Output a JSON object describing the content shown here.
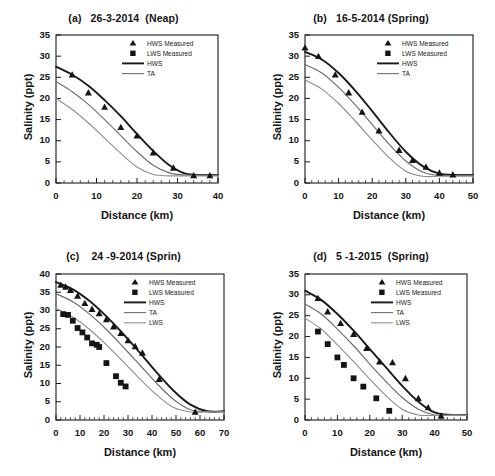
{
  "figure": {
    "background": "#ffffff",
    "panel_count": 4
  },
  "common": {
    "xlabel": "Distance (km)",
    "ylabel": "Salinity (ppt)",
    "legend_labels": {
      "hws_measured": "HWS Measured",
      "lws_measured": "LWS Measured",
      "hws": "HWS",
      "ta": "TA",
      "lws": "LWS"
    },
    "colors": {
      "hws_line": "#1a1a1a",
      "ta_line": "#6e6e6e",
      "lws_line": "#8f8f8f",
      "marker": "#141414",
      "axis": "#1a1a1a",
      "text": "#141414"
    }
  },
  "chart_data": [
    {
      "id": "a",
      "type": "scatter",
      "title": "(a)   26-3-2014  (Neap)",
      "xlabel": "Distance (km)",
      "ylabel": "Salinity (ppt)",
      "xlim": [
        0,
        40
      ],
      "ylim": [
        0,
        35
      ],
      "xticks": [
        0,
        10,
        20,
        30,
        40
      ],
      "yticks": [
        0,
        5,
        10,
        15,
        20,
        25,
        30,
        35
      ],
      "grid": false,
      "legend_position": "top-right",
      "legend": [
        "HWS Measured",
        "LWS Measured",
        "HWS",
        "TA"
      ],
      "series": [
        {
          "name": "HWS Measured",
          "marker": "triangle",
          "x": [
            4,
            8,
            12,
            16,
            20,
            24,
            29,
            34,
            38
          ],
          "y": [
            25.6,
            21.4,
            18.0,
            13.2,
            11.2,
            7.2,
            3.6,
            1.8,
            1.8
          ]
        },
        {
          "name": "HWS",
          "marker": "line",
          "color": "#1a1a1a",
          "x": [
            0,
            4,
            8,
            12,
            16,
            20,
            24,
            28,
            32,
            36,
            40
          ],
          "y": [
            27.5,
            25.6,
            23.0,
            19.6,
            15.8,
            11.6,
            7.6,
            4.2,
            2.2,
            1.9,
            1.9
          ]
        },
        {
          "name": "TA",
          "marker": "line",
          "color": "#6e6e6e",
          "x": [
            0,
            4,
            8,
            12,
            16,
            20,
            24,
            28,
            32,
            36,
            40
          ],
          "y": [
            24.0,
            21.6,
            18.6,
            15.0,
            11.2,
            7.4,
            4.2,
            2.4,
            1.9,
            1.9,
            1.9
          ]
        },
        {
          "name": "LWS",
          "marker": "line",
          "color": "#8f8f8f",
          "x": [
            0,
            4,
            8,
            12,
            16,
            20,
            24,
            28,
            32,
            36,
            40
          ],
          "y": [
            20.0,
            17.4,
            14.2,
            10.6,
            7.0,
            3.8,
            2.0,
            1.7,
            1.7,
            1.7,
            1.7
          ]
        }
      ]
    },
    {
      "id": "b",
      "type": "scatter",
      "title": "(b)   16-5-2014 (Spring)",
      "xlabel": "Distance (km)",
      "ylabel": "Salinity (ppt)",
      "xlim": [
        0,
        50
      ],
      "ylim": [
        0,
        35
      ],
      "xticks": [
        0,
        10,
        20,
        30,
        40,
        50
      ],
      "yticks": [
        0,
        5,
        10,
        15,
        20,
        25,
        30,
        35
      ],
      "grid": false,
      "legend_position": "top-right",
      "legend": [
        "HWS Measured",
        "LWS Measured",
        "HWS",
        "TA"
      ],
      "series": [
        {
          "name": "HWS Measured",
          "marker": "triangle",
          "x": [
            0,
            4,
            9,
            13,
            17,
            22,
            28,
            32,
            36,
            40,
            44
          ],
          "y": [
            32.0,
            30.0,
            25.6,
            21.4,
            16.8,
            12.4,
            7.8,
            5.4,
            3.8,
            2.4,
            2.0
          ]
        },
        {
          "name": "HWS",
          "marker": "line",
          "color": "#1a1a1a",
          "x": [
            0,
            5,
            10,
            15,
            20,
            25,
            30,
            35,
            40,
            45,
            50
          ],
          "y": [
            31.0,
            29.2,
            26.0,
            21.8,
            17.0,
            12.0,
            7.4,
            4.0,
            2.2,
            1.9,
            1.9
          ]
        },
        {
          "name": "TA",
          "marker": "line",
          "color": "#6e6e6e",
          "x": [
            0,
            5,
            10,
            15,
            20,
            25,
            30,
            35,
            40,
            45,
            50
          ],
          "y": [
            28.0,
            26.0,
            22.6,
            18.4,
            13.8,
            9.2,
            5.2,
            2.6,
            1.8,
            1.8,
            1.8
          ]
        },
        {
          "name": "LWS",
          "marker": "line",
          "color": "#8f8f8f",
          "x": [
            0,
            5,
            10,
            15,
            20,
            25,
            30,
            35,
            40,
            45,
            50
          ],
          "y": [
            24.4,
            22.2,
            18.8,
            14.6,
            10.2,
            6.0,
            2.8,
            1.6,
            1.6,
            1.6,
            1.6
          ]
        }
      ]
    },
    {
      "id": "c",
      "type": "scatter",
      "title": "(c)    24 -9-2014 (Sprin)",
      "xlabel": "Distance (km)",
      "ylabel": "Salinity (ppt)",
      "xlim": [
        0,
        70
      ],
      "ylim": [
        0,
        40
      ],
      "xticks": [
        0,
        10,
        20,
        30,
        40,
        50,
        60,
        70
      ],
      "yticks": [
        0,
        5,
        10,
        15,
        20,
        25,
        30,
        35,
        40
      ],
      "grid": false,
      "legend_position": "top-right",
      "legend": [
        "HWS Measured",
        "LWS Measured",
        "HWS",
        "TA",
        "LWS"
      ],
      "series": [
        {
          "name": "HWS Measured",
          "marker": "triangle",
          "x": [
            2,
            4,
            6,
            9,
            12,
            15,
            18,
            21,
            24,
            27,
            30,
            33,
            36,
            43,
            58
          ],
          "y": [
            37.0,
            36.5,
            35.6,
            34.0,
            32.0,
            30.4,
            29.2,
            27.6,
            25.6,
            23.8,
            21.8,
            20.2,
            18.4,
            11.2,
            2.2
          ]
        },
        {
          "name": "LWS Measured",
          "marker": "square",
          "x": [
            3,
            5,
            7,
            9,
            11,
            13,
            15,
            17,
            18,
            21,
            25,
            27,
            29
          ],
          "y": [
            29.0,
            28.8,
            27.2,
            25.2,
            24.0,
            22.6,
            21.0,
            20.6,
            20.0,
            15.6,
            12.0,
            10.2,
            9.2
          ]
        },
        {
          "name": "HWS",
          "marker": "line",
          "color": "#1a1a1a",
          "x": [
            0,
            7,
            14,
            21,
            28,
            35,
            42,
            49,
            56,
            63,
            70
          ],
          "y": [
            37.8,
            35.8,
            32.6,
            28.4,
            23.6,
            18.4,
            13.0,
            8.0,
            4.2,
            2.4,
            2.4
          ]
        },
        {
          "name": "TA",
          "marker": "line",
          "color": "#6e6e6e",
          "x": [
            0,
            7,
            14,
            21,
            28,
            35,
            42,
            49,
            56,
            63,
            70
          ],
          "y": [
            34.6,
            32.4,
            29.0,
            24.8,
            20.0,
            15.0,
            10.0,
            5.6,
            2.8,
            2.3,
            2.3
          ]
        },
        {
          "name": "LWS",
          "marker": "line",
          "color": "#8f8f8f",
          "x": [
            0,
            7,
            14,
            21,
            28,
            35,
            42,
            49,
            56,
            63,
            70
          ],
          "y": [
            30.6,
            28.2,
            24.8,
            20.6,
            16.0,
            11.2,
            6.8,
            3.4,
            2.2,
            2.2,
            2.2
          ]
        }
      ]
    },
    {
      "id": "d",
      "type": "scatter",
      "title": "(d)   5 -1-2015  (Spring)",
      "xlabel": "Distance (km)",
      "ylabel": "Salinity (ppt)",
      "xlim": [
        0,
        50
      ],
      "ylim": [
        0,
        35
      ],
      "xticks": [
        0,
        10,
        20,
        30,
        40,
        50
      ],
      "yticks": [
        0,
        5,
        10,
        15,
        20,
        25,
        30,
        35
      ],
      "grid": false,
      "legend_position": "top-right",
      "legend": [
        "HWS Measured",
        "LWS Measured",
        "HWS",
        "TA",
        "LWS"
      ],
      "series": [
        {
          "name": "HWS Measured",
          "marker": "triangle",
          "x": [
            4,
            7,
            11,
            15,
            19,
            23,
            27,
            31,
            35,
            38,
            42
          ],
          "y": [
            29.2,
            26.0,
            23.2,
            20.6,
            17.2,
            14.0,
            13.8,
            10.0,
            5.2,
            3.0,
            1.0
          ]
        },
        {
          "name": "LWS Measured",
          "marker": "square",
          "x": [
            4,
            7,
            10,
            12,
            15,
            18,
            22,
            26
          ],
          "y": [
            21.2,
            18.2,
            15.0,
            13.2,
            10.0,
            8.0,
            5.2,
            2.2
          ]
        },
        {
          "name": "HWS",
          "marker": "line",
          "color": "#1a1a1a",
          "x": [
            0,
            5,
            10,
            15,
            20,
            25,
            30,
            35,
            40,
            45,
            50
          ],
          "y": [
            31.0,
            28.8,
            25.4,
            21.4,
            17.0,
            12.6,
            8.2,
            4.4,
            1.8,
            1.2,
            1.2
          ]
        },
        {
          "name": "TA",
          "marker": "line",
          "color": "#6e6e6e",
          "x": [
            0,
            5,
            10,
            15,
            20,
            25,
            30,
            35,
            40,
            45,
            50
          ],
          "y": [
            27.8,
            25.4,
            21.8,
            17.8,
            13.4,
            9.2,
            5.4,
            2.6,
            1.2,
            1.2,
            1.2
          ]
        },
        {
          "name": "LWS",
          "marker": "line",
          "color": "#8f8f8f",
          "x": [
            0,
            5,
            10,
            15,
            20,
            25,
            30,
            35,
            40,
            45,
            50
          ],
          "y": [
            24.4,
            21.8,
            18.0,
            14.0,
            9.8,
            5.8,
            2.6,
            1.2,
            1.1,
            1.1,
            1.1
          ]
        }
      ]
    }
  ]
}
